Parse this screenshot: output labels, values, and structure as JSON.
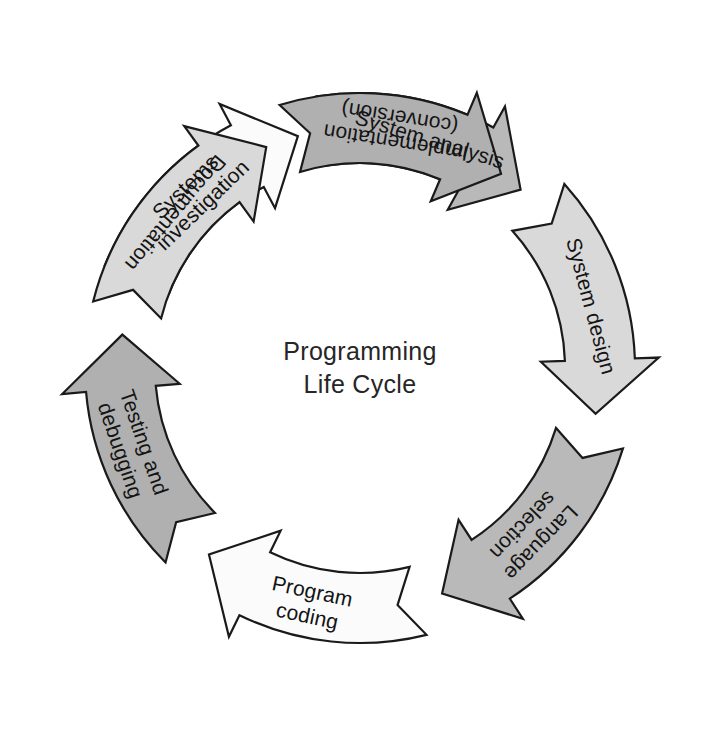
{
  "diagram": {
    "center_lines": [
      "Programming",
      "Life Cycle"
    ],
    "center_x": 360,
    "center_y": 368,
    "direction": "clockwise",
    "stroke_color": "#1a1a1a",
    "background_color": "#ffffff",
    "palette": {
      "white": "#fbfbfb",
      "light_gray": "#d9d9d9",
      "medium_gray": "#b9b9b9",
      "dark_gray": "#b0b0b0"
    },
    "stages": [
      {
        "index": 1,
        "id": "systems-investigation",
        "label": "Systems investigation",
        "lines": [
          "Systems",
          "investigation"
        ],
        "fill": "#fbfbfb",
        "shade": "white",
        "start_angle": -68,
        "end_angle": -15,
        "text_angle": -44,
        "text_flip": false
      },
      {
        "index": 2,
        "id": "system-analysis",
        "label": "System analysis",
        "lines": [
          "System analysis"
        ],
        "fill": "#b9b9b9",
        "shade": "medium",
        "start_angle": -9,
        "end_angle": 42,
        "text_angle": 17,
        "text_flip": false
      },
      {
        "index": 3,
        "id": "system-design",
        "label": "System design",
        "lines": [
          "System design"
        ],
        "fill": "#d9d9d9",
        "shade": "light",
        "start_angle": 48,
        "end_angle": 101,
        "text_angle": 75,
        "text_flip": false
      },
      {
        "index": 4,
        "id": "language-selection",
        "label": "Language selection",
        "lines": [
          "Language",
          "selection"
        ],
        "fill": "#b9b9b9",
        "shade": "medium",
        "start_angle": 107,
        "end_angle": 160,
        "text_angle": 134,
        "text_flip": false
      },
      {
        "index": 5,
        "id": "program-coding",
        "label": "Program coding",
        "lines": [
          "Program",
          "coding"
        ],
        "fill": "#fbfbfb",
        "shade": "white",
        "start_angle": 166,
        "end_angle": 219,
        "text_angle": 192,
        "text_flip": true
      },
      {
        "index": 6,
        "id": "testing-and-debugging",
        "label": "Testing and debugging",
        "lines": [
          "Testing and",
          "debugging"
        ],
        "fill": "#b0b0b0",
        "shade": "dark",
        "start_angle": 225,
        "end_angle": 278,
        "text_angle": 251,
        "text_flip": true
      },
      {
        "index": 7,
        "id": "documentation",
        "label": "Documentation",
        "lines": [
          "Documentation"
        ],
        "fill": "#d9d9d9",
        "shade": "light",
        "start_angle": 284,
        "end_angle": 337,
        "text_angle": 310,
        "text_flip": true
      },
      {
        "index": 8,
        "id": "implementation-conversion",
        "label": "Implementation (conversion)",
        "lines": [
          "Implementation",
          "(conversion)"
        ],
        "fill": "#b0b0b0",
        "shade": "dark",
        "start_angle": 343,
        "end_angle": 396,
        "text_angle": 369,
        "text_flip": true
      }
    ],
    "geometry": {
      "inner_radius": 205,
      "outer_radius": 275,
      "head_inner_radius": 181,
      "head_outer_radius": 299,
      "head_sweep_degrees": 13
    }
  }
}
